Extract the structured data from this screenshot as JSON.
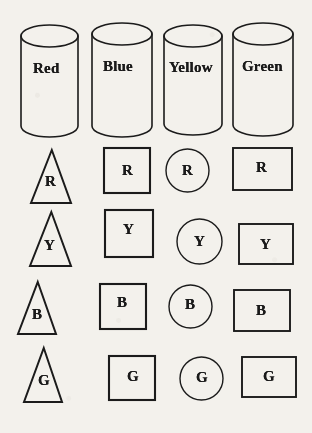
{
  "figure": {
    "background_color": "#f3f1ec",
    "ink_color": "#1b1b1b",
    "width": 312,
    "height": 433
  },
  "containers": {
    "shape_name": "cylinder",
    "items": [
      {
        "label": "Red",
        "x": 21,
        "y": 25,
        "w": 57,
        "h": 112,
        "label_x": 33,
        "label_y": 61
      },
      {
        "label": "Blue",
        "x": 92,
        "y": 23,
        "w": 60,
        "h": 114,
        "label_x": 103,
        "label_y": 59
      },
      {
        "label": "Yellow",
        "x": 164,
        "y": 25,
        "w": 58,
        "h": 110,
        "label_x": 169,
        "label_y": 60
      },
      {
        "label": "Green",
        "x": 233,
        "y": 23,
        "w": 60,
        "h": 113,
        "label_x": 242,
        "label_y": 59
      }
    ]
  },
  "rows": [
    {
      "letter": "R",
      "cells": [
        {
          "shape": "triangle",
          "x": 31,
          "y": 150,
          "w": 40,
          "h": 53,
          "letter_x": 45,
          "letter_y": 174
        },
        {
          "shape": "square",
          "x": 104,
          "y": 148,
          "w": 46,
          "h": 45,
          "letter_x": 122,
          "letter_y": 163
        },
        {
          "shape": "circle",
          "x": 166,
          "y": 149,
          "w": 43,
          "h": 43,
          "letter_x": 182,
          "letter_y": 163
        },
        {
          "shape": "rectangle",
          "x": 233,
          "y": 148,
          "w": 59,
          "h": 42,
          "letter_x": 256,
          "letter_y": 160
        }
      ]
    },
    {
      "letter": "Y",
      "cells": [
        {
          "shape": "triangle",
          "x": 30,
          "y": 212,
          "w": 41,
          "h": 54,
          "letter_x": 44,
          "letter_y": 238
        },
        {
          "shape": "square",
          "x": 105,
          "y": 210,
          "w": 48,
          "h": 47,
          "letter_x": 123,
          "letter_y": 222
        },
        {
          "shape": "circle",
          "x": 177,
          "y": 219,
          "w": 45,
          "h": 45,
          "letter_x": 194,
          "letter_y": 234
        },
        {
          "shape": "rectangle",
          "x": 239,
          "y": 224,
          "w": 54,
          "h": 40,
          "letter_x": 260,
          "letter_y": 237
        }
      ]
    },
    {
      "letter": "B",
      "cells": [
        {
          "shape": "triangle",
          "x": 18,
          "y": 282,
          "w": 38,
          "h": 52,
          "letter_x": 32,
          "letter_y": 307
        },
        {
          "shape": "square",
          "x": 100,
          "y": 284,
          "w": 46,
          "h": 45,
          "letter_x": 117,
          "letter_y": 295
        },
        {
          "shape": "circle",
          "x": 169,
          "y": 285,
          "w": 43,
          "h": 43,
          "letter_x": 185,
          "letter_y": 297
        },
        {
          "shape": "rectangle",
          "x": 234,
          "y": 290,
          "w": 56,
          "h": 41,
          "letter_x": 256,
          "letter_y": 303
        }
      ]
    },
    {
      "letter": "G",
      "cells": [
        {
          "shape": "triangle",
          "x": 24,
          "y": 348,
          "w": 38,
          "h": 54,
          "letter_x": 38,
          "letter_y": 373
        },
        {
          "shape": "square",
          "x": 109,
          "y": 356,
          "w": 46,
          "h": 44,
          "letter_x": 127,
          "letter_y": 369
        },
        {
          "shape": "circle",
          "x": 180,
          "y": 357,
          "w": 43,
          "h": 43,
          "letter_x": 196,
          "letter_y": 370
        },
        {
          "shape": "rectangle",
          "x": 242,
          "y": 357,
          "w": 54,
          "h": 40,
          "letter_x": 263,
          "letter_y": 369
        }
      ]
    }
  ]
}
